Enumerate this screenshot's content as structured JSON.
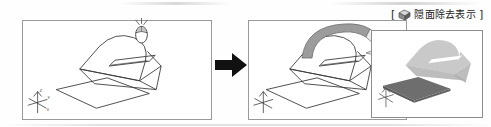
{
  "figure": {
    "type": "cad-tutorial-sequence",
    "panel_count": 3
  },
  "caption": {
    "open_bracket": "[",
    "close_bracket": "]",
    "icon": "shaded-cube-icon",
    "label": "隠面除去表示"
  },
  "panels": [
    {
      "id": "before",
      "name": "wireframe-view",
      "render_mode": "wireframe",
      "objects": [
        "arch-solid-wireframe",
        "slot-rectangle-wireframe",
        "base-plate-wireframe"
      ],
      "has_mouse_cursor": true,
      "has_axis_marker": true
    },
    {
      "id": "middle",
      "name": "wireframe-view-selected",
      "render_mode": "wireframe",
      "objects": [
        "arch-solid-wireframe",
        "slot-rectangle-wireframe",
        "base-plate-wireframe"
      ],
      "has_mouse_cursor": false,
      "has_axis_marker": true
    },
    {
      "id": "after",
      "name": "hidden-surface-removed-view",
      "render_mode": "shaded",
      "objects": [
        "arch-solid-shaded",
        "slot-rectangle-white",
        "base-plate-shaded"
      ],
      "has_mouse_cursor": false,
      "has_axis_marker": true
    }
  ],
  "connectors": [
    {
      "name": "black-step-arrow",
      "direction": "right",
      "color": "#111111"
    },
    {
      "name": "gray-curved-arrow",
      "direction": "right-curved",
      "color": "#9b9b9b"
    }
  ],
  "colors": {
    "panel_border": "#9a9a9a",
    "wireframe_stroke": "#3a3a3a",
    "shaded_light": "#c9c9c9",
    "shaded_dark": "#6e6e6e",
    "arrow_black": "#111111",
    "arrow_gray_fill": "#a8a8a8",
    "arrow_gray_light": "#ededed",
    "background": "#ffffff"
  },
  "mouse_icon": {
    "name": "mouse-pointer-icon",
    "description": "mouse with motion marks"
  },
  "axis_marker": {
    "name": "coordinate-axis-icon",
    "labels": [
      "Z",
      "Y",
      "X"
    ]
  }
}
